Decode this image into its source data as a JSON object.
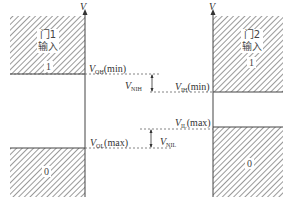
{
  "diagram": {
    "type": "noise-margin-diagram",
    "axis_label": "V",
    "gate1": {
      "title_line1": "门1",
      "title_line2": "输入",
      "high_region_value": "1",
      "low_region_value": "0"
    },
    "gate2": {
      "title_line1": "门2",
      "title_line2": "输入",
      "high_region_value": "1",
      "low_region_value": "0"
    },
    "levels": {
      "voh_min": {
        "sym": "V",
        "sub": "OH",
        "suffix": "(min)"
      },
      "vih_min": {
        "sym": "V",
        "sub": "IH",
        "suffix": "(min)"
      },
      "vil_max": {
        "sym": "V",
        "sub": "IL",
        "suffix": "(max)"
      },
      "vol_max": {
        "sym": "V",
        "sub": "OL",
        "suffix": "(max)"
      },
      "vnih": {
        "sym": "V",
        "sub": "NIH"
      },
      "vnil": {
        "sym": "V",
        "sub": "NIL"
      },
      "vo": {
        "sym": "V",
        "sub": "O"
      }
    },
    "colors": {
      "hatch": "#555555",
      "line": "#444444",
      "dash": "#666666"
    }
  }
}
